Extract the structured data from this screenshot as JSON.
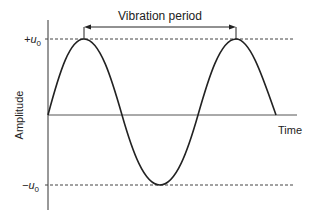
{
  "diagram": {
    "title_arrow_label": "Vibration period",
    "x_axis_label": "Time",
    "y_axis_label": "Amplitude",
    "pos_amp_label": "+u",
    "pos_amp_sub": "0",
    "neg_amp_label": "−u",
    "neg_amp_sub": "0",
    "curve": "sine wave, 1.5 periods"
  }
}
